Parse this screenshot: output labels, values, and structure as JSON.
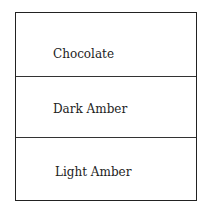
{
  "diagram": {
    "sections": [
      {
        "label": "Chocolate"
      },
      {
        "label": "Dark Amber"
      },
      {
        "label": "Light Amber"
      }
    ]
  }
}
